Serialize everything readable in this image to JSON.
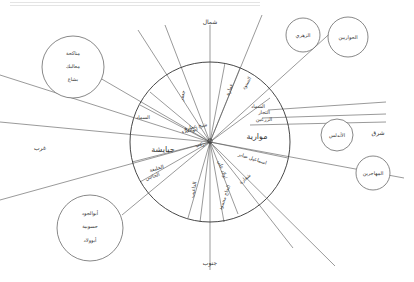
{
  "header": {
    "faded_caption": ""
  },
  "directions": {
    "north": "شمال",
    "south": "جنوب",
    "east": "شرق",
    "west": "غرب"
  },
  "outer_circles": [
    {
      "id": "top-left",
      "lines": [
        "مناكحة",
        "معالبك",
        "بشاع"
      ]
    },
    {
      "id": "zuhri",
      "lines": [
        "الزهري"
      ]
    },
    {
      "id": "hawariyyin",
      "lines": [
        "الحواريين"
      ]
    },
    {
      "id": "andalus",
      "lines": [
        "الأندلس"
      ]
    },
    {
      "id": "muhajirin",
      "lines": [
        "المهاجرين"
      ]
    },
    {
      "id": "bottom-left",
      "lines": [
        "أبوالجود",
        "حسوبية",
        "أبوولاد"
      ]
    }
  ],
  "wheel": {
    "large_labels": {
      "east_sector": "موارية",
      "west_sector": "جبايشة"
    },
    "small_labels": [
      "السماد",
      "التجار",
      "الزرعين",
      "اسماعيل صابر",
      "شفارة",
      "الحاج محمود",
      "اولاد علي",
      "الداعيب",
      "ابوالعلاء",
      "شيخ عمارة",
      "زكي",
      "السماد",
      "جعفر",
      "الخليفة",
      "الحاجي",
      "عمارة",
      "السنود"
    ]
  },
  "colors": {
    "ink": "#333333",
    "line": "#555555",
    "background": "#ffffff"
  }
}
